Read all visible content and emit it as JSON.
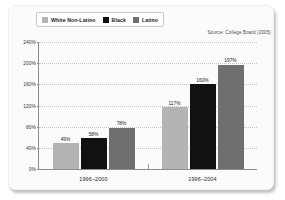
{
  "source_note": "Source: College Board (2005)",
  "legend": {
    "items": [
      {
        "label": "White Non-Latino",
        "color": "#b4b4b4"
      },
      {
        "label": "Black",
        "color": "#111111"
      },
      {
        "label": "Latino",
        "color": "#6f6f6f"
      }
    ]
  },
  "chart_data": {
    "type": "bar",
    "title": "",
    "subtitle": "",
    "xlabel": "",
    "ylabel": "",
    "categories": [
      "1996–2000",
      "1996–2004"
    ],
    "series": [
      {
        "name": "White Non-Latino",
        "color": "#b4b4b4",
        "values": [
          49,
          117
        ],
        "labels": [
          "49%",
          "117%"
        ]
      },
      {
        "name": "Black",
        "color": "#111111",
        "values": [
          58,
          160
        ],
        "labels": [
          "58%",
          "160%"
        ]
      },
      {
        "name": "Latino",
        "color": "#6f6f6f",
        "values": [
          78,
          197
        ],
        "labels": [
          "78%",
          "197%"
        ]
      }
    ],
    "ylim": [
      0,
      240
    ],
    "yticks": [
      0,
      40,
      80,
      120,
      160,
      200,
      240
    ],
    "ytick_labels": [
      "0%",
      "40%",
      "80%",
      "120%",
      "160%",
      "200%",
      "240%"
    ],
    "grid": true,
    "legend_position": "top-left",
    "annotation": "Source: College Board (2005)"
  }
}
